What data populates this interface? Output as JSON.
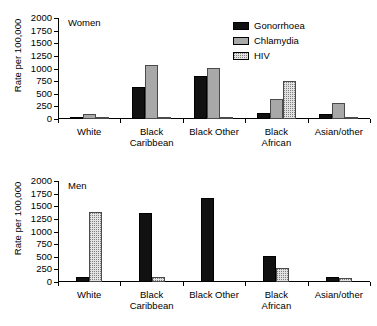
{
  "figure": {
    "ylabel": "Rate per 100,000",
    "categories": [
      "White",
      "Black\nCaribbean",
      "Black Other",
      "Black\nAfrican",
      "Asian/other"
    ],
    "y_ticks": [
      0,
      250,
      500,
      750,
      1000,
      1250,
      1500,
      1750,
      2000
    ],
    "ylim": [
      0,
      2000
    ]
  },
  "legend": {
    "items": [
      {
        "label": "Gonorrhoea",
        "color": "#111111",
        "swatch": "solid-black"
      },
      {
        "label": "Chlamydia",
        "color": "#a8a8a8",
        "swatch": "solid-gray"
      },
      {
        "label": "HIV",
        "color": "#e2e2e2",
        "swatch": "dotted-light-gray"
      }
    ]
  },
  "panels": [
    {
      "caption": "Women"
    },
    {
      "caption": "Men"
    }
  ],
  "chart_data": [
    {
      "type": "bar",
      "title": "Women",
      "xlabel": "",
      "ylabel": "Rate per 100,000",
      "ylim": [
        0,
        2000
      ],
      "yticks": [
        0,
        250,
        500,
        750,
        1000,
        1250,
        1500,
        1750,
        2000
      ],
      "grid": false,
      "legend_position": "top-right",
      "categories": [
        "White",
        "Black Caribbean",
        "Black Other",
        "Black African",
        "Asian/other"
      ],
      "series": [
        {
          "name": "Gonorrhoea",
          "values": [
            30,
            625,
            850,
            125,
            100
          ]
        },
        {
          "name": "Chlamydia",
          "values": [
            100,
            1075,
            1020,
            390,
            310
          ]
        },
        {
          "name": "HIV",
          "values": [
            15,
            45,
            35,
            760,
            10
          ]
        }
      ]
    },
    {
      "type": "bar",
      "title": "Men",
      "xlabel": "",
      "ylabel": "Rate per 100,000",
      "ylim": [
        0,
        2000
      ],
      "yticks": [
        0,
        250,
        500,
        750,
        1000,
        1250,
        1500,
        1750,
        2000
      ],
      "grid": false,
      "legend_position": "none",
      "categories": [
        "White",
        "Black Caribbean",
        "Black Other",
        "Black African",
        "Asian/other"
      ],
      "series": [
        {
          "name": "Gonorrhoea",
          "values": [
            100,
            1375,
            1670,
            515,
            90
          ]
        },
        {
          "name": "HIV",
          "values": [
            1390,
            95,
            0,
            285,
            75
          ]
        }
      ]
    }
  ]
}
